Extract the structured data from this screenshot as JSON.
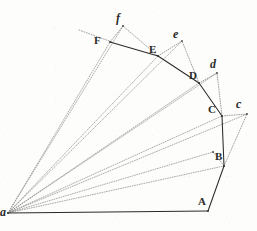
{
  "figure": {
    "background_color": "#fdfdfb",
    "ink_color": "#2b2b2b",
    "faint_ink_color": "#8a8a8a",
    "width": 257,
    "height": 231,
    "points": [
      {
        "id": "a",
        "label": "a",
        "case": "lower",
        "x": 8,
        "y": 213,
        "label_x": 0,
        "label_y": 206
      },
      {
        "id": "A",
        "label": "A",
        "case": "upper",
        "x": 208,
        "y": 211,
        "label_x": 198,
        "label_y": 196
      },
      {
        "id": "B",
        "label": "B",
        "case": "upper",
        "x": 224,
        "y": 166,
        "label_x": 215,
        "label_y": 151
      },
      {
        "id": "C",
        "label": "C",
        "case": "upper",
        "x": 222,
        "y": 116,
        "label_x": 208,
        "label_y": 104
      },
      {
        "id": "D",
        "label": "D",
        "case": "upper",
        "x": 199,
        "y": 83,
        "label_x": 189,
        "label_y": 70
      },
      {
        "id": "E",
        "label": "E",
        "case": "upper",
        "x": 158,
        "y": 56,
        "label_x": 149,
        "label_y": 44
      },
      {
        "id": "F",
        "label": "F",
        "case": "upper",
        "x": 110,
        "y": 42,
        "label_x": 94,
        "label_y": 35
      },
      {
        "id": "b",
        "label": "b",
        "case": "lower",
        "x": 213,
        "y": 152,
        "label_x": 0,
        "label_y": 0
      },
      {
        "id": "c",
        "label": "c",
        "case": "lower",
        "x": 247,
        "y": 114,
        "label_x": 236,
        "label_y": 98
      },
      {
        "id": "d",
        "label": "d",
        "case": "lower",
        "x": 217,
        "y": 73,
        "label_x": 210,
        "label_y": 58
      },
      {
        "id": "e",
        "label": "e",
        "case": "lower",
        "x": 182,
        "y": 41,
        "label_x": 173,
        "label_y": 28
      },
      {
        "id": "f",
        "label": "f",
        "case": "lower",
        "x": 123,
        "y": 26,
        "label_x": 116,
        "label_y": 12
      }
    ],
    "solid_edges": [
      {
        "name": "edge-a-A",
        "from": "a",
        "to": "A"
      },
      {
        "name": "edge-A-B",
        "from": "A",
        "to": "B"
      },
      {
        "name": "edge-B-C",
        "from": "B",
        "to": "C"
      },
      {
        "name": "edge-C-D",
        "from": "C",
        "to": "D"
      },
      {
        "name": "edge-D-E",
        "from": "D",
        "to": "E"
      },
      {
        "name": "edge-E-F",
        "from": "E",
        "to": "F"
      }
    ],
    "radial_dotted_edges": [
      {
        "name": "ray-a-B",
        "from": "a",
        "to": "B"
      },
      {
        "name": "ray-a-C",
        "from": "a",
        "to": "C"
      },
      {
        "name": "ray-a-D",
        "from": "a",
        "to": "D"
      },
      {
        "name": "ray-a-E",
        "from": "a",
        "to": "E"
      },
      {
        "name": "ray-a-F",
        "from": "a",
        "to": "F"
      },
      {
        "name": "ray-a-f",
        "from": "a",
        "to": "f"
      },
      {
        "name": "ray-a-e",
        "from": "a",
        "to": "e"
      },
      {
        "name": "ray-a-d",
        "from": "a",
        "to": "d"
      },
      {
        "name": "ray-a-c",
        "from": "a",
        "to": "c"
      },
      {
        "name": "ray-a-b",
        "from": "a",
        "to": "b"
      }
    ],
    "offset_dotted_edges": [
      {
        "name": "offset-B-b",
        "from": "B",
        "to": "b"
      },
      {
        "name": "offset-B-c",
        "from": "B",
        "to": "c"
      },
      {
        "name": "offset-C-c",
        "from": "C",
        "to": "c"
      },
      {
        "name": "offset-C-d",
        "from": "C",
        "to": "d"
      },
      {
        "name": "offset-D-d",
        "from": "D",
        "to": "d"
      },
      {
        "name": "offset-D-e",
        "from": "D",
        "to": "e"
      },
      {
        "name": "offset-E-e",
        "from": "E",
        "to": "e"
      },
      {
        "name": "offset-E-f",
        "from": "E",
        "to": "f"
      },
      {
        "name": "offset-F-f",
        "from": "F",
        "to": "f"
      }
    ],
    "stray_dotted_edges": [
      {
        "name": "stray-left-tick",
        "x1": 79,
        "y1": 30,
        "x2": 112,
        "y2": 42
      }
    ]
  }
}
